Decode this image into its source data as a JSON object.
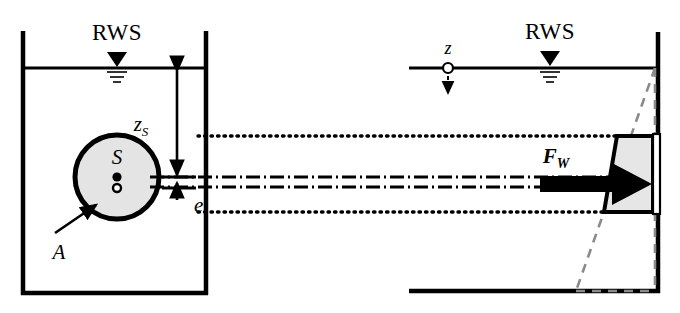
{
  "figure": {
    "background_color": "#ffffff",
    "ink_color": "#000000",
    "fill_gray": "#e0e0e0",
    "width": 680,
    "height": 313
  },
  "labels": {
    "rws_left": "RWS",
    "rws_right": "RWS",
    "depth_to_centroid": "z",
    "depth_to_centroid_sub": "S",
    "eccentricity": "e",
    "area": "A",
    "centroid": "S",
    "depth_axis": "z",
    "resultant_force": "F",
    "resultant_force_sub": "W"
  },
  "elements": {
    "left_vessel": "vessel-cross-section",
    "right_vessel": "vessel-side-view",
    "submerged_area": "circular-area",
    "pressure_distribution": "trapezoidal-pressure-wedge",
    "full_pressure_triangle": "dashed-hydrostatic-triangle",
    "water_surface_marker": "triangle-waterline-symbol",
    "projection_lines": "dotted-projection",
    "centroid_axis": "dash-dot-centerline",
    "pressure_center_axis": "dash-dot-pressure-center-line"
  },
  "geometry": {
    "left_wall_x": 22,
    "left_vessel_right_x": 207,
    "water_surface_y": 68,
    "left_floor_y": 294,
    "circle_center_x": 117,
    "circle_center_y": 177,
    "circle_radius": 43,
    "centroid_line_y": 177,
    "pressure_center_line_y": 187,
    "upper_dotted_y": 136,
    "lower_dotted_y": 212,
    "right_start_x": 408,
    "right_wall_x": 658,
    "right_floor_y": 291,
    "wedge_top_x": 617,
    "wedge_bottom_x": 604
  }
}
